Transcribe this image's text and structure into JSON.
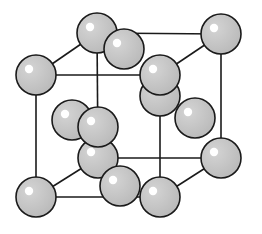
{
  "diagram": {
    "type": "crystal-lattice",
    "structure": "face-centered cubic unit cell",
    "colors": {
      "atom_fill": "#c4c4c4",
      "atom_stroke": "#1a1a1a",
      "highlight": "#ffffff",
      "edge": "#1a1a1a",
      "background": "#ffffff"
    },
    "atom_radius": 20,
    "atoms": [
      {
        "id": "back-top-left",
        "x": 97,
        "y": 33,
        "kind": "corner"
      },
      {
        "id": "back-top-right",
        "x": 221,
        "y": 34,
        "kind": "corner"
      },
      {
        "id": "back-face-center",
        "x": 160,
        "y": 96,
        "kind": "face"
      },
      {
        "id": "back-bottom-left",
        "x": 98,
        "y": 158,
        "kind": "corner"
      },
      {
        "id": "back-bottom-right",
        "x": 221,
        "y": 158,
        "kind": "corner"
      },
      {
        "id": "left-face-center",
        "x": 72,
        "y": 120,
        "kind": "face"
      },
      {
        "id": "top-face-center",
        "x": 124,
        "y": 49,
        "kind": "face"
      },
      {
        "id": "front-top-left",
        "x": 36,
        "y": 75,
        "kind": "corner"
      },
      {
        "id": "right-face-center",
        "x": 195,
        "y": 118,
        "kind": "face"
      },
      {
        "id": "front-top-right",
        "x": 160,
        "y": 75,
        "kind": "corner"
      },
      {
        "id": "front-face-center",
        "x": 98,
        "y": 127,
        "kind": "face"
      },
      {
        "id": "bottom-face-center",
        "x": 120,
        "y": 186,
        "kind": "face"
      },
      {
        "id": "front-bottom-left",
        "x": 36,
        "y": 197,
        "kind": "corner"
      },
      {
        "id": "front-bottom-right",
        "x": 160,
        "y": 197,
        "kind": "corner"
      }
    ],
    "edges": [
      [
        "front-top-left",
        "front-top-right"
      ],
      [
        "front-top-left",
        "front-bottom-left"
      ],
      [
        "front-top-right",
        "front-bottom-right"
      ],
      [
        "front-bottom-left",
        "front-bottom-right"
      ],
      [
        "back-top-left",
        "back-top-right"
      ],
      [
        "back-top-left",
        "back-bottom-left"
      ],
      [
        "back-top-right",
        "back-bottom-right"
      ],
      [
        "back-bottom-left",
        "back-bottom-right"
      ],
      [
        "front-top-left",
        "back-top-left"
      ],
      [
        "front-top-right",
        "back-top-right"
      ],
      [
        "front-bottom-left",
        "back-bottom-left"
      ],
      [
        "front-bottom-right",
        "back-bottom-right"
      ]
    ]
  }
}
